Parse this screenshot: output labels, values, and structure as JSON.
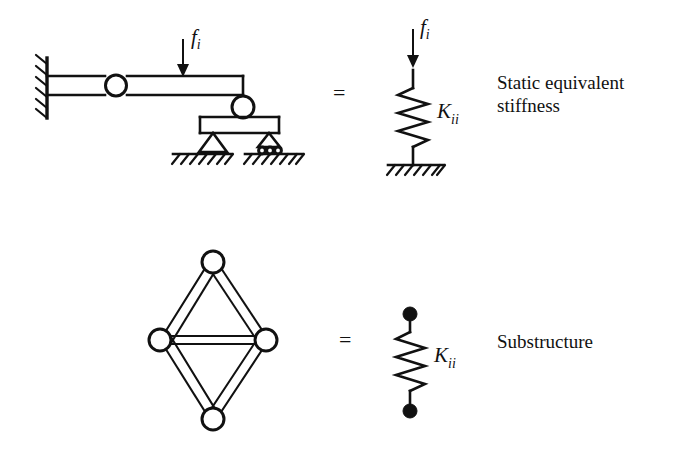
{
  "figure": {
    "background_color": "#ffffff",
    "line_color": "#111111"
  },
  "rows": [
    {
      "id": "row-static-equivalent",
      "equals_sign": "=",
      "caption_lines": [
        "Static equivalent",
        "stiffness"
      ],
      "left_model": {
        "name": "cantilever-beam-with-supports",
        "force_label": "f",
        "force_subscript": "i",
        "support_types": [
          "fixed-wall",
          "pin-hinge",
          "roller-joint",
          "pinned-support",
          "roller-support"
        ]
      },
      "right_model": {
        "name": "spring-to-ground",
        "force_label": "f",
        "force_subscript": "i",
        "stiffness_label": "K",
        "stiffness_subscript": "ii",
        "spring_coils": 6,
        "ground": "hatched-ground"
      }
    },
    {
      "id": "row-substructure",
      "equals_sign": "=",
      "caption_lines": [
        "Substructure"
      ],
      "left_model": {
        "name": "diamond-truss",
        "nodes": 4,
        "members": 5,
        "node_style": "open-circle"
      },
      "right_model": {
        "name": "spring-between-nodes",
        "stiffness_label": "K",
        "stiffness_subscript": "ii",
        "spring_coils": 6,
        "node_style": "solid-dot"
      }
    }
  ]
}
